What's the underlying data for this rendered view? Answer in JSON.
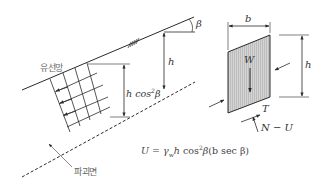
{
  "diagram": {
    "type": "infinite-slope-seepage-diagram",
    "labels": {
      "flow_net": "유선망",
      "failure_plane": "파괴면",
      "slope_angle": "β",
      "depth": "h",
      "depth_cos": "h cos",
      "depth_cos_sup": "2",
      "depth_cos_beta": "β",
      "slice_width": "b",
      "slice_height": "h",
      "weight": "W",
      "shear": "T",
      "effective_normal": "N − U"
    },
    "formula": {
      "lhs": "U",
      "eq": " = ",
      "gamma": "γ",
      "gamma_sub": "w",
      "h": "h",
      "cos": " cos",
      "cos_sup": "2",
      "beta": "β",
      "paren": "(b sec β)"
    },
    "colors": {
      "line": "#2a2a2a",
      "slice_fill": "#c8c8c8",
      "label_gray": "#777777"
    }
  }
}
